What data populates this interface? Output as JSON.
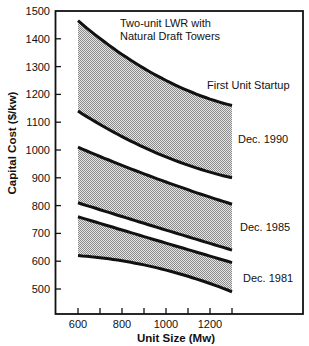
{
  "chart_data": {
    "type": "area",
    "title": "",
    "annotation": [
      "Two-unit LWR with",
      "Natural Draft Towers"
    ],
    "legend_title": "First Unit Startup",
    "xlabel": "Unit Size (Mw)",
    "ylabel": "Capital Cost ($/kw)",
    "xlim": [
      500,
      1500
    ],
    "ylim": [
      400,
      1500
    ],
    "x_ticks": [
      600,
      700,
      800,
      900,
      1000,
      1100,
      1200,
      1300
    ],
    "x_tick_labels": [
      "600",
      "800",
      "1000",
      "1200"
    ],
    "y_ticks": [
      500,
      600,
      700,
      800,
      900,
      1000,
      1100,
      1200,
      1300,
      1400,
      1500
    ],
    "y_tick_labels": [
      "500",
      "600",
      "700",
      "800",
      "900",
      "1000",
      "1100",
      "1200",
      "1300",
      "1400",
      "1500"
    ],
    "grid": false,
    "x": [
      600,
      1000,
      1300
    ],
    "series": [
      {
        "name": "Dec. 1990",
        "upper": [
          1465,
          1250,
          1160
        ],
        "lower": [
          1140,
          975,
          900
        ]
      },
      {
        "name": "Dec. 1985",
        "upper": [
          1010,
          885,
          805
        ],
        "lower": [
          810,
          712,
          640
        ]
      },
      {
        "name": "Dec. 1981",
        "upper": [
          760,
          665,
          595
        ],
        "lower": [
          620,
          568,
          490
        ]
      }
    ],
    "fill": "stippled gray",
    "line_color": "#111111"
  }
}
